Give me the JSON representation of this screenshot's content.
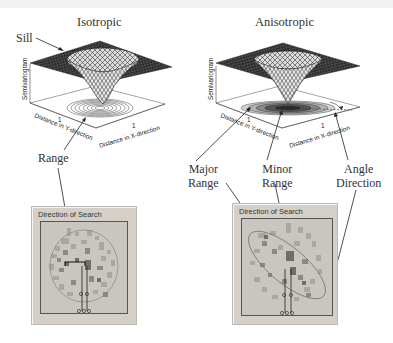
{
  "left": {
    "title": "Isotropic",
    "annotations": {
      "sill": "Sill",
      "range": "Range"
    },
    "axes": {
      "z": "Semivariogram",
      "y": "Distance in Y-direction",
      "x": "Distance in X-direction",
      "tick": "1"
    },
    "panel": {
      "title": "Direction of Search"
    }
  },
  "right": {
    "title": "Anisotropic",
    "annotations": {
      "major_range": "Major\nRange",
      "minor_range": "Minor\nRange",
      "angle_direction": "Angle\nDirection"
    },
    "axes": {
      "z": "Semivariogram",
      "y": "Distance in Y-direction",
      "x": "Distance in X-direction",
      "tick": "1"
    },
    "panel": {
      "title": "Direction of Search"
    }
  },
  "colors": {
    "surface": "#3a3a3a",
    "panel_bg": "#d4d0c8",
    "cell_light": "#b3b0aa",
    "cell_mid": "#8d8a86",
    "cell_dark": "#6f6c6a",
    "cell_pink": "#9a8a8e"
  }
}
